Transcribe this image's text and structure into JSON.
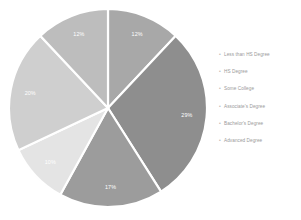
{
  "chart_data": {
    "type": "pie",
    "title": "",
    "subtitle": "",
    "xlabel": "",
    "ylabel": "",
    "grid": false,
    "legend_position": "right",
    "start_angle_deg": 0,
    "direction": "clockwise",
    "categories": [
      "Less than HS Degree",
      "HS Degree",
      "Some College",
      "Associate's Degree",
      "Bachelor's Degree",
      "Advanced Degree"
    ],
    "values": [
      12,
      29,
      17,
      10,
      20,
      12
    ],
    "value_labels": [
      "12%",
      "29%",
      "17%",
      "10%",
      "20%",
      "12%"
    ],
    "colors": [
      "#a8a8a8",
      "#8e8e8e",
      "#9c9c9c",
      "#e4e4e4",
      "#cfcfcf",
      "#bdbdbd"
    ],
    "slices": [
      {
        "label": "Less than HS Degree",
        "value": 12,
        "value_label": "12%",
        "color": "#a8a8a8"
      },
      {
        "label": "HS Degree",
        "value": 29,
        "value_label": "29%",
        "color": "#8e8e8e"
      },
      {
        "label": "Some College",
        "value": 17,
        "value_label": "17%",
        "color": "#9c9c9c"
      },
      {
        "label": "Associate's Degree",
        "value": 10,
        "value_label": "10%",
        "color": "#e4e4e4"
      },
      {
        "label": "Bachelor's Degree",
        "value": 20,
        "value_label": "20%",
        "color": "#cfcfcf"
      },
      {
        "label": "Advanced Degree",
        "value": 12,
        "value_label": "12%",
        "color": "#bdbdbd"
      }
    ]
  },
  "legend": {
    "marker_glyph": "•",
    "items": [
      {
        "label": "Less than HS Degree"
      },
      {
        "label": "HS Degree"
      },
      {
        "label": "Some College"
      },
      {
        "label": "Associate's Degree"
      },
      {
        "label": "Bachelor's Degree"
      },
      {
        "label": "Advanced Degree"
      }
    ]
  },
  "style": {
    "background": "#ffffff",
    "separator_color": "#ffffff",
    "label_color": "#ffffff",
    "legend_text_color": "#9a9a9a"
  }
}
